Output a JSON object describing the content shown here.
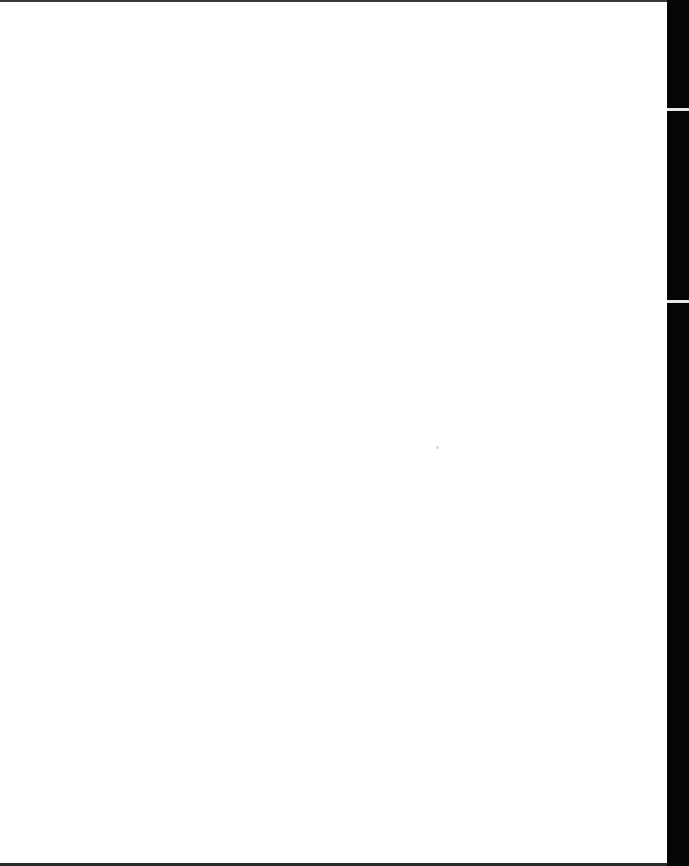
{
  "document": {
    "type": "scanned-page",
    "content": "",
    "colors": {
      "page": "#ffffff",
      "scan_border": "#050505"
    }
  }
}
